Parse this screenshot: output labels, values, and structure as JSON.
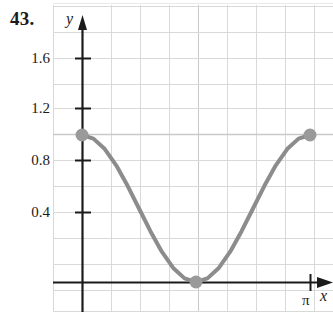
{
  "figure": {
    "problem_number": "43.",
    "axis_labels": {
      "x": "x",
      "y": "y"
    },
    "x_tick_labels": [
      "π"
    ],
    "y_tick_labels": [
      "1.6",
      "1.2",
      "0.8",
      "0.4"
    ]
  },
  "colors": {
    "curve": "#8c8c8c",
    "point": "#9a9a9a",
    "axis": "#1b1b1b",
    "grid_minor": "#d9d9d9",
    "grid_major": "#c9c9c9",
    "text": "#1b1b1b",
    "background": "#ffffff"
  },
  "chart_data": {
    "type": "line",
    "title": "",
    "xlabel": "x",
    "ylabel": "y",
    "xlim": [
      -0.27,
      3.68
    ],
    "ylim": [
      -0.23,
      1.79
    ],
    "x_ticks": [
      3.1416
    ],
    "x_tick_labels": [
      "π"
    ],
    "y_ticks": [
      0.4,
      0.8,
      1.2,
      1.6
    ],
    "y_tick_labels": [
      "0.4",
      "0.8",
      "1.2",
      "1.6"
    ],
    "grid": true,
    "legend": null,
    "series": [
      {
        "name": "cos^2(x)",
        "style": "solid",
        "color": "#8c8c8c",
        "x": [
          0.0,
          0.1571,
          0.3142,
          0.4712,
          0.6283,
          0.7854,
          0.9425,
          1.0996,
          1.2566,
          1.4137,
          1.5708,
          1.7279,
          1.885,
          2.042,
          2.1991,
          2.3562,
          2.5133,
          2.6704,
          2.8274,
          2.9845,
          3.1416
        ],
        "y": [
          1.0,
          0.9755,
          0.9045,
          0.7939,
          0.6545,
          0.5,
          0.3455,
          0.2061,
          0.0955,
          0.0245,
          0.0,
          0.0245,
          0.0955,
          0.2061,
          0.3455,
          0.5,
          0.6545,
          0.7939,
          0.9045,
          0.9755,
          1.0
        ]
      }
    ],
    "points": [
      {
        "label": "left-endpoint",
        "x": 0.0,
        "y": 1.0,
        "filled": true
      },
      {
        "label": "minimum",
        "x": 1.5708,
        "y": 0.0,
        "filled": true
      },
      {
        "label": "right-endpoint",
        "x": 3.1416,
        "y": 1.0,
        "filled": true
      }
    ],
    "annotations": []
  }
}
